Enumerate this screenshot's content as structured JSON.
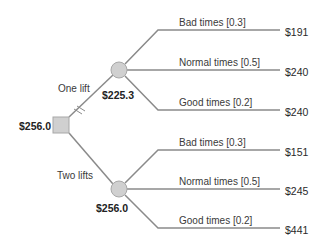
{
  "root": {
    "value": "$256.0",
    "shape": "decision-square"
  },
  "options": [
    {
      "label": "One lift",
      "expected_value": "$225.3",
      "pruned": true,
      "outcomes": [
        {
          "label": "Bad times [0.3]",
          "payoff": "$191"
        },
        {
          "label": "Normal times [0.5]",
          "payoff": "$240"
        },
        {
          "label": "Good times [0.2]",
          "payoff": "$240"
        }
      ]
    },
    {
      "label": "Two lifts",
      "expected_value": "$256.0",
      "pruned": false,
      "outcomes": [
        {
          "label": "Bad times [0.3]",
          "payoff": "$151"
        },
        {
          "label": "Normal times [0.5]",
          "payoff": "$245"
        },
        {
          "label": "Good times [0.2]",
          "payoff": "$441"
        }
      ]
    }
  ],
  "colors": {
    "line": "#8a8a8a",
    "node_fill": "#d0d0d0",
    "node_stroke": "#a0a0a0"
  }
}
